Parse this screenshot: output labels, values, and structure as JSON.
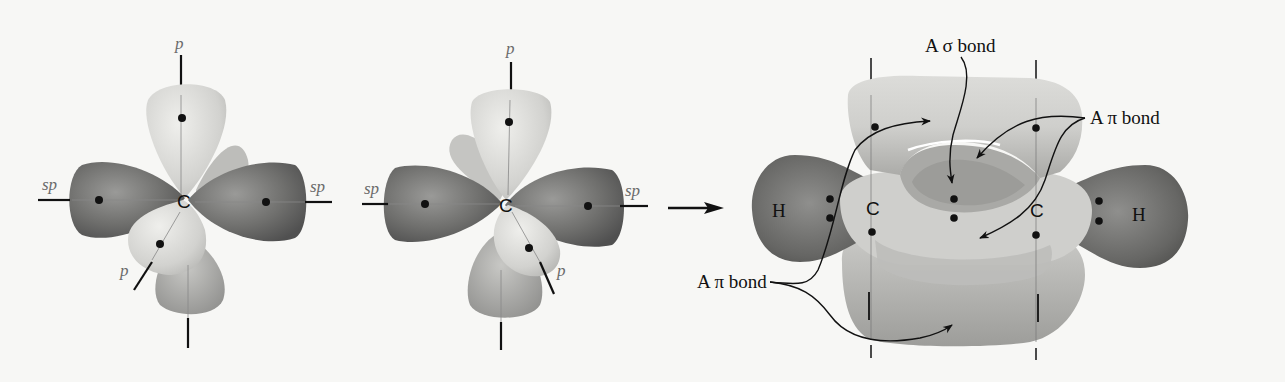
{
  "figure": {
    "colors": {
      "background": "#f7f7f5",
      "sp_lobe": "#7a7a7a",
      "p_lobe": "#d9d9d6",
      "ink": "#111111"
    }
  },
  "panel_left": {
    "center_atom": "C",
    "axis_labels": {
      "top": "p",
      "left": "sp",
      "right": "sp",
      "front": "p"
    }
  },
  "panel_middle": {
    "center_atom": "C",
    "axis_labels": {
      "top": "p",
      "left": "sp",
      "right": "sp",
      "front": "p"
    }
  },
  "reaction_arrow": {
    "direction": "right"
  },
  "panel_right": {
    "atoms": {
      "h_left": "H",
      "c_left": "C",
      "c_right": "C",
      "h_right": "H"
    },
    "callouts": {
      "sigma_bond": "A σ bond",
      "pi_bond_right": "A π bond",
      "pi_bond_left": "A π bond"
    }
  }
}
